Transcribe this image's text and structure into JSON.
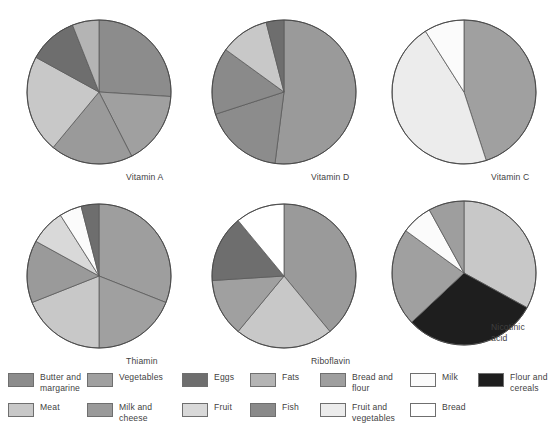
{
  "figure": {
    "background": "#ffffff",
    "stroke": "#5a5a5a",
    "text_color": "#3f3f3f"
  },
  "palette": {
    "butter_and_margarine": "#8c8c8c",
    "meat": "#c8c8c8",
    "vegetables": "#a0a0a0",
    "milk_and_cheese": "#9a9a9a",
    "eggs": "#6e6e6e",
    "fruit": "#d9d9d9",
    "fats": "#b4b4b4",
    "fish": "#8a8a8a",
    "bread_and_flour": "#9e9e9e",
    "fruit_and_vegetables": "#ececec",
    "milk": "#fbfbfb",
    "bread": "#ffffff",
    "flour_and_cereals": "#1e1e1e"
  },
  "charts": [
    {
      "id": "vitamin-a",
      "label": "Vitamin A",
      "label_left": 118,
      "label_top": 168,
      "cx": 91,
      "cy": 88,
      "r": 72,
      "slices": [
        {
          "name": "Butter and margarine",
          "color_key": "butter_and_margarine",
          "value": 26.0
        },
        {
          "name": "Vegetables",
          "color_key": "vegetables",
          "value": 16.5
        },
        {
          "name": "Milk and cheese",
          "color_key": "milk_and_cheese",
          "value": 18.5
        },
        {
          "name": "Meat",
          "color_key": "meat",
          "value": 22.0
        },
        {
          "name": "Eggs",
          "color_key": "eggs",
          "value": 11.0
        },
        {
          "name": "Fats",
          "color_key": "fats",
          "value": 6.0
        }
      ]
    },
    {
      "id": "vitamin-d",
      "label": "Vitamin D",
      "label_left": 118,
      "label_top": 168,
      "cx": 91,
      "cy": 88,
      "r": 72,
      "slices": [
        {
          "name": "Milk and cheese",
          "color_key": "milk_and_cheese",
          "value": 52.0
        },
        {
          "name": "Butter and margarine",
          "color_key": "butter_and_margarine",
          "value": 18.0
        },
        {
          "name": "Fish",
          "color_key": "fish",
          "value": 15.0
        },
        {
          "name": "Meat",
          "color_key": "meat",
          "value": 11.0
        },
        {
          "name": "Eggs",
          "color_key": "eggs",
          "value": 4.0
        }
      ]
    },
    {
      "id": "vitamin-c",
      "label": "Vitamin C",
      "label_left": 118,
      "label_top": 168,
      "cx": 91,
      "cy": 88,
      "r": 72,
      "slices": [
        {
          "name": "Vegetables",
          "color_key": "vegetables",
          "value": 45.0
        },
        {
          "name": "Fruit and vegetables",
          "color_key": "fruit_and_vegetables",
          "value": 46.0
        },
        {
          "name": "Milk",
          "color_key": "milk",
          "value": 9.0
        }
      ]
    },
    {
      "id": "thiamin",
      "label": "Thiamin",
      "label_left": 118,
      "label_top": 168,
      "cx": 91,
      "cy": 88,
      "r": 72,
      "slices": [
        {
          "name": "Bread and flour",
          "color_key": "bread_and_flour",
          "value": 31.0
        },
        {
          "name": "Vegetables",
          "color_key": "vegetables",
          "value": 19.0
        },
        {
          "name": "Meat",
          "color_key": "meat",
          "value": 19.0
        },
        {
          "name": "Milk and cheese",
          "color_key": "milk_and_cheese",
          "value": 14.0
        },
        {
          "name": "Fruit",
          "color_key": "fruit",
          "value": 8.0
        },
        {
          "name": "Milk",
          "color_key": "milk",
          "value": 5.0
        },
        {
          "name": "Eggs",
          "color_key": "eggs",
          "value": 4.0
        }
      ]
    },
    {
      "id": "riboflavin",
      "label": "Riboflavin",
      "label_left": 118,
      "label_top": 168,
      "cx": 91,
      "cy": 88,
      "r": 72,
      "slices": [
        {
          "name": "Milk and cheese",
          "color_key": "milk_and_cheese",
          "value": 39.0
        },
        {
          "name": "Meat",
          "color_key": "meat",
          "value": 22.0
        },
        {
          "name": "Vegetables",
          "color_key": "vegetables",
          "value": 13.0
        },
        {
          "name": "Eggs",
          "color_key": "eggs",
          "value": 15.0
        },
        {
          "name": "Bread",
          "color_key": "bread",
          "value": 11.0
        }
      ]
    },
    {
      "id": "nicotinic-acid",
      "label": "Nicotinic\nacid",
      "label_left": 118,
      "label_top": 134,
      "cx": 91,
      "cy": 85,
      "r": 72,
      "slices": [
        {
          "name": "Meat",
          "color_key": "meat",
          "value": 33.0
        },
        {
          "name": "Flour and cereals",
          "color_key": "flour_and_cereals",
          "value": 30.0
        },
        {
          "name": "Vegetables",
          "color_key": "vegetables",
          "value": 22.0
        },
        {
          "name": "Milk",
          "color_key": "milk",
          "value": 7.0
        },
        {
          "name": "Bread and flour",
          "color_key": "bread_and_flour",
          "value": 8.0
        }
      ]
    }
  ],
  "legend": {
    "items": [
      {
        "label": "Butter and\nmargarine",
        "color_key": "butter_and_margarine",
        "left": 8,
        "top": 4
      },
      {
        "label": "Meat",
        "color_key": "meat",
        "left": 8,
        "top": 34
      },
      {
        "label": "Vegetables",
        "color_key": "vegetables",
        "left": 87,
        "top": 4
      },
      {
        "label": "Milk and\ncheese",
        "color_key": "milk_and_cheese",
        "left": 87,
        "top": 34
      },
      {
        "label": "Eggs",
        "color_key": "eggs",
        "left": 182,
        "top": 4
      },
      {
        "label": "Fruit",
        "color_key": "fruit",
        "left": 182,
        "top": 34
      },
      {
        "label": "Fats",
        "color_key": "fats",
        "left": 250,
        "top": 4
      },
      {
        "label": "Fish",
        "color_key": "fish",
        "left": 250,
        "top": 34
      },
      {
        "label": "Bread and\nflour",
        "color_key": "bread_and_flour",
        "left": 320,
        "top": 4
      },
      {
        "label": "Fruit and\nvegetables",
        "color_key": "fruit_and_vegetables",
        "left": 320,
        "top": 34
      },
      {
        "label": "Milk",
        "color_key": "milk",
        "left": 410,
        "top": 4
      },
      {
        "label": "Bread",
        "color_key": "bread",
        "left": 410,
        "top": 34
      },
      {
        "label": "Flour and\ncereals",
        "color_key": "flour_and_cereals",
        "left": 478,
        "top": 4
      }
    ]
  },
  "chart_data": {
    "type": "pie",
    "unit": "percent of total intake",
    "legend_position": "bottom",
    "panels": [
      {
        "title": "Vitamin A",
        "categories": [
          "Butter and margarine",
          "Vegetables",
          "Milk and cheese",
          "Meat",
          "Eggs",
          "Fats"
        ],
        "values": [
          26,
          16.5,
          18.5,
          22,
          11,
          6
        ]
      },
      {
        "title": "Vitamin D",
        "categories": [
          "Milk and cheese",
          "Butter and margarine",
          "Fish",
          "Meat",
          "Eggs"
        ],
        "values": [
          52,
          18,
          15,
          11,
          4
        ]
      },
      {
        "title": "Vitamin C",
        "categories": [
          "Vegetables",
          "Fruit and vegetables",
          "Milk"
        ],
        "values": [
          45,
          46,
          9
        ]
      },
      {
        "title": "Thiamin",
        "categories": [
          "Bread and flour",
          "Vegetables",
          "Meat",
          "Milk and cheese",
          "Fruit",
          "Milk",
          "Eggs"
        ],
        "values": [
          31,
          19,
          19,
          14,
          8,
          5,
          4
        ]
      },
      {
        "title": "Riboflavin",
        "categories": [
          "Milk and cheese",
          "Meat",
          "Vegetables",
          "Eggs",
          "Bread"
        ],
        "values": [
          39,
          22,
          13,
          15,
          11
        ]
      },
      {
        "title": "Nicotinic acid",
        "categories": [
          "Meat",
          "Flour and cereals",
          "Vegetables",
          "Milk",
          "Bread and flour"
        ],
        "values": [
          33,
          30,
          22,
          7,
          8
        ]
      }
    ]
  }
}
